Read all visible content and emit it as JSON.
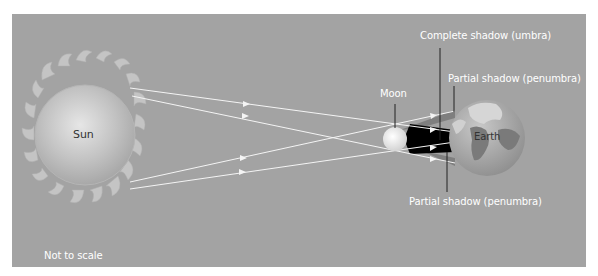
{
  "diagram": {
    "type": "solar-eclipse",
    "labels": {
      "sun": "Sun",
      "moon": "Moon",
      "earth": "Earth",
      "umbra": "Complete shadow (umbra)",
      "penumbra_top": "Partial shadow (penumbra)",
      "penumbra_bottom": "Partial shadow (penumbra)",
      "note": "Not to scale"
    },
    "colors": {
      "background": "#a3a3a3",
      "rays": "#f2f2f2",
      "umbra": "#000000",
      "penumbra": "#7a7a7a",
      "leader_lines": "#222222"
    }
  }
}
